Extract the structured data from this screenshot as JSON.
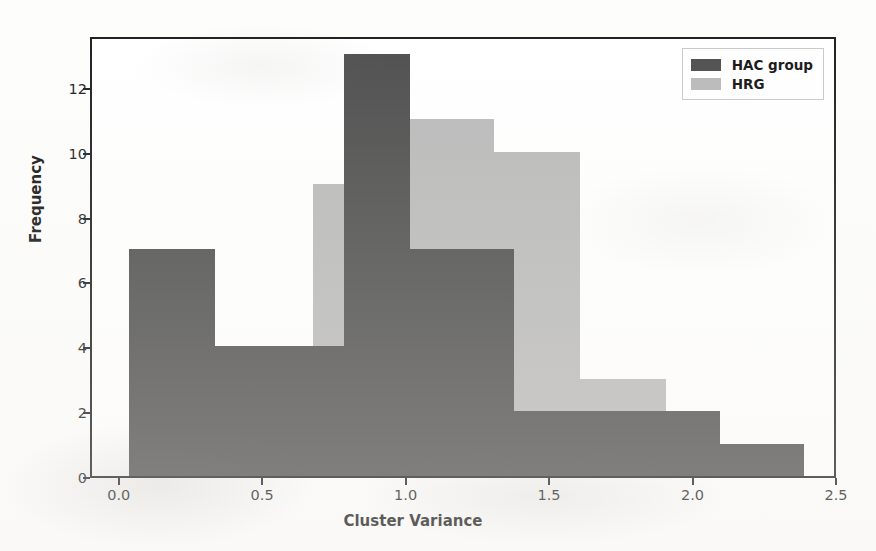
{
  "chart_data": {
    "type": "bar",
    "subtype": "overlapping-histogram",
    "title": "",
    "xlabel": "Cluster Variance",
    "ylabel": "Frequency",
    "xlim": [
      -0.1,
      2.5
    ],
    "ylim": [
      0,
      13.6
    ],
    "xticks": [
      "0.0",
      "0.5",
      "1.0",
      "1.5",
      "2.0",
      "2.5"
    ],
    "xtick_values": [
      0.0,
      0.5,
      1.0,
      1.5,
      2.0,
      2.5
    ],
    "yticks": [
      "0",
      "2",
      "4",
      "6",
      "8",
      "10",
      "12"
    ],
    "ytick_values": [
      0,
      2,
      4,
      6,
      8,
      10,
      12
    ],
    "grid": false,
    "legend_position": "upper right",
    "bin_width": 0.3,
    "series": [
      {
        "name": "HAC group",
        "color": "#4d4d4d",
        "bins": [
          {
            "x0": 0.03,
            "x1": 0.33,
            "value": 7
          },
          {
            "x0": 0.33,
            "x1": 0.63,
            "value": 4
          },
          {
            "x0": 0.63,
            "x1": 0.78,
            "value": 4
          },
          {
            "x0": 0.78,
            "x1": 1.01,
            "value": 13
          },
          {
            "x0": 1.01,
            "x1": 1.37,
            "value": 7
          },
          {
            "x0": 1.37,
            "x1": 1.8,
            "value": 2
          },
          {
            "x0": 1.8,
            "x1": 2.09,
            "value": 2
          },
          {
            "x0": 2.09,
            "x1": 2.38,
            "value": 1
          }
        ]
      },
      {
        "name": "HRG",
        "color": "#b9b9b9",
        "bins": [
          {
            "x0": 0.67,
            "x1": 0.78,
            "value": 9
          },
          {
            "x0": 0.78,
            "x1": 1.01,
            "value": 9
          },
          {
            "x0": 1.01,
            "x1": 1.3,
            "value": 11
          },
          {
            "x0": 1.3,
            "x1": 1.6,
            "value": 10
          },
          {
            "x0": 1.6,
            "x1": 1.9,
            "value": 3
          }
        ]
      }
    ]
  },
  "legend": {
    "items": [
      {
        "label": "HAC group",
        "color": "#4d4d4d",
        "swatch": "hac"
      },
      {
        "label": "HRG",
        "color": "#b9b9b9",
        "swatch": "hrg"
      }
    ]
  }
}
